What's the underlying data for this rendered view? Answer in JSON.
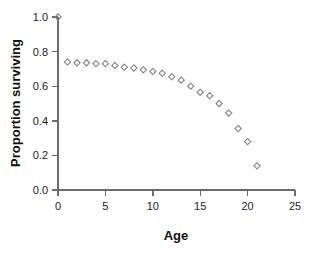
{
  "chart_data": {
    "type": "scatter",
    "title": "",
    "xlabel": "Age",
    "ylabel": "Proportion surviving",
    "xlim": [
      0,
      25
    ],
    "ylim": [
      0.0,
      1.0
    ],
    "xticks": [
      0,
      5,
      10,
      15,
      20,
      25
    ],
    "yticks": [
      0.0,
      0.2,
      0.4,
      0.6,
      0.8,
      1.0
    ],
    "xtick_labels": [
      "0",
      "5",
      "10",
      "15",
      "20",
      "25"
    ],
    "ytick_labels": [
      "0.0",
      "0.2",
      "0.4",
      "0.6",
      "0.8",
      "1.0"
    ],
    "grid": false,
    "legend": false,
    "marker": "open-diamond",
    "marker_color": "#808080",
    "axis_color": "#6b6b6b",
    "background": "#ffffff",
    "x": [
      0,
      1,
      2,
      3,
      4,
      5,
      6,
      7,
      8,
      9,
      10,
      11,
      12,
      13,
      14,
      15,
      16,
      17,
      18,
      19,
      20,
      21
    ],
    "values": [
      1.0,
      0.74,
      0.735,
      0.735,
      0.73,
      0.73,
      0.72,
      0.71,
      0.705,
      0.695,
      0.685,
      0.675,
      0.655,
      0.635,
      0.6,
      0.565,
      0.545,
      0.5,
      0.445,
      0.355,
      0.28,
      0.14
    ],
    "series": [
      {
        "name": "Proportion surviving",
        "values": [
          1.0,
          0.74,
          0.735,
          0.735,
          0.73,
          0.73,
          0.72,
          0.71,
          0.705,
          0.695,
          0.685,
          0.675,
          0.655,
          0.635,
          0.6,
          0.565,
          0.545,
          0.5,
          0.445,
          0.355,
          0.28,
          0.14
        ]
      }
    ]
  },
  "axis_titles": {
    "x": "Age",
    "y": "Proportion surviving"
  }
}
